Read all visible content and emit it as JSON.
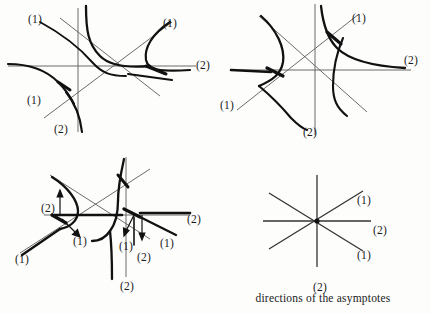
{
  "figure": {
    "caption": "directions of the asymptotes",
    "label_one": "(1)",
    "label_two": "(2)",
    "colors": {
      "background": "#fdfdfc",
      "ink": "#1a1a1a",
      "thin_line": "#5a5a5a",
      "curve": "#111111"
    }
  },
  "panels": [
    {
      "id": "panel-top-left",
      "name": "three-branch-curve-configuration-a",
      "labels": [
        {
          "text": "(1)",
          "x": 28,
          "y": 14
        },
        {
          "text": "(1)",
          "x": 163,
          "y": 18
        },
        {
          "text": "(2)",
          "x": 196,
          "y": 62
        },
        {
          "text": "(1)",
          "x": 27,
          "y": 96
        },
        {
          "text": "(2)",
          "x": 54,
          "y": 125
        }
      ]
    },
    {
      "id": "panel-top-right",
      "name": "three-branch-curve-configuration-b",
      "labels": [
        {
          "text": "(1)",
          "x": 352,
          "y": 14
        },
        {
          "text": "(2)",
          "x": 402,
          "y": 56
        },
        {
          "text": "(1)",
          "x": 222,
          "y": 101
        },
        {
          "text": "(2)",
          "x": 303,
          "y": 128
        }
      ]
    },
    {
      "id": "panel-bottom-left",
      "name": "three-branch-curve-configuration-c",
      "labels": [
        {
          "text": "(2)",
          "x": 41,
          "y": 204
        },
        {
          "text": "(2)",
          "x": 187,
          "y": 216
        },
        {
          "text": "(1)",
          "x": 72,
          "y": 237
        },
        {
          "text": "(1)",
          "x": 160,
          "y": 238
        },
        {
          "text": "(1)",
          "x": 125,
          "y": 240
        },
        {
          "text": "(1)",
          "x": 17,
          "y": 255
        },
        {
          "text": "(2)",
          "x": 139,
          "y": 252
        },
        {
          "text": "(2)",
          "x": 121,
          "y": 282
        }
      ]
    },
    {
      "id": "panel-bottom-right",
      "name": "asymptote-direction-star",
      "labels": [
        {
          "text": "(1)",
          "x": 357,
          "y": 196
        },
        {
          "text": "(2)",
          "x": 372,
          "y": 226
        },
        {
          "text": "(1)",
          "x": 357,
          "y": 251
        },
        {
          "text": "(2)",
          "x": 313,
          "y": 283
        }
      ]
    }
  ]
}
